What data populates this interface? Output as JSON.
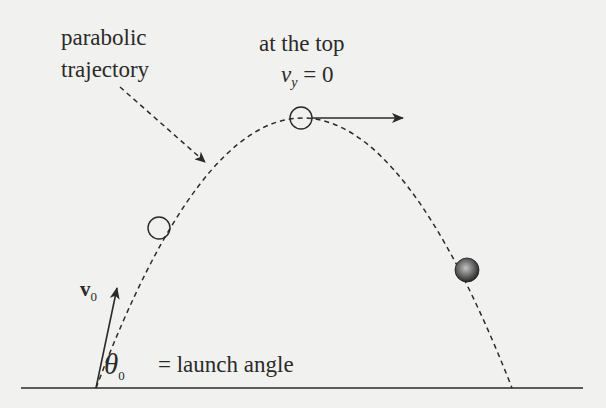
{
  "diagram": {
    "labels": {
      "parabolic_line1": "parabolic",
      "parabolic_line2": "trajectory",
      "at_the_top": "at the top",
      "vy_var": "v",
      "vy_sub": "y",
      "vy_eq": " = 0",
      "v0_var": "v",
      "v0_sub": "0",
      "theta_var": "θ",
      "theta_sub": "0",
      "launch_angle": "= launch angle"
    },
    "colors": {
      "background": "#f1f1ef",
      "ink": "#2a2a2a",
      "ball_highlight": "#b5b5b5",
      "ball_dark": "#2b2b2b"
    },
    "geometry": {
      "ground": {
        "x1": 21,
        "y1": 388,
        "x2": 583,
        "y2": 388
      },
      "launch_point": {
        "x": 96,
        "y": 388
      },
      "landing_point": {
        "x": 512,
        "y": 388
      },
      "apex": {
        "x": 301,
        "y": 118
      },
      "markers": [
        {
          "name": "ascending-position",
          "x": 159,
          "y": 228,
          "r": 11,
          "filled": false
        },
        {
          "name": "apex-position",
          "x": 301,
          "y": 118,
          "r": 11,
          "filled": false
        },
        {
          "name": "descending-ball",
          "x": 467,
          "y": 270,
          "r": 12,
          "filled": true
        }
      ],
      "vectors": [
        {
          "name": "initial-velocity",
          "x1": 96,
          "y1": 388,
          "x2": 117,
          "y2": 288
        },
        {
          "name": "apex-horizontal-velocity",
          "x1": 312,
          "y1": 118,
          "x2": 403,
          "y2": 118
        }
      ],
      "pointer": {
        "x1": 120,
        "y1": 87,
        "x2": 205,
        "y2": 162
      }
    }
  }
}
